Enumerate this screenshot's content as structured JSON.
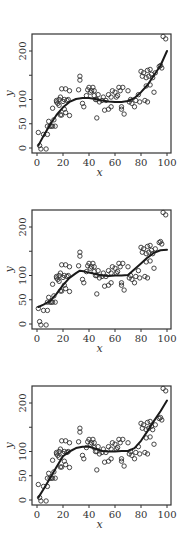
{
  "chart_data": [
    {
      "type": "scatter",
      "panel": "a",
      "caption": "(a)",
      "xlabel": "x",
      "ylabel": "y",
      "xlim": [
        -3,
        103
      ],
      "ylim": [
        -12,
        235
      ],
      "xticks": [
        0,
        20,
        40,
        60,
        80,
        100
      ],
      "yticks": [
        0,
        50,
        100,
        150,
        200
      ],
      "ytick_labels": [
        "0",
        "50",
        "100",
        "",
        "200"
      ],
      "grid": false,
      "fit": {
        "name": "smooth fit (a)",
        "x": [
          1,
          5,
          10,
          15,
          20,
          25,
          30,
          35,
          40,
          45,
          50,
          55,
          60,
          65,
          70,
          75,
          80,
          85,
          90,
          95,
          100
        ],
        "y": [
          5,
          25,
          48,
          68,
          84,
          95,
          101,
          103,
          103,
          101,
          98,
          96,
          95,
          95,
          97,
          103,
          115,
          130,
          150,
          170,
          200
        ]
      }
    },
    {
      "type": "scatter",
      "panel": "b",
      "caption": "(b)",
      "xlabel": "x",
      "ylabel": "y",
      "xlim": [
        -3,
        103
      ],
      "ylim": [
        -12,
        235
      ],
      "xticks": [
        0,
        20,
        40,
        60,
        80,
        100
      ],
      "yticks": [
        0,
        50,
        100,
        150,
        200
      ],
      "ytick_labels": [
        "0",
        "50",
        "100",
        "",
        "200"
      ],
      "grid": false,
      "fit": {
        "name": "smooth fit (b)",
        "x": [
          1,
          5,
          10,
          15,
          20,
          25,
          30,
          33,
          37,
          40,
          45,
          50,
          55,
          60,
          65,
          70,
          75,
          80,
          85,
          90,
          95,
          100
        ],
        "y": [
          35,
          40,
          47,
          62,
          80,
          95,
          105,
          110,
          108,
          106,
          103,
          100,
          99,
          100,
          100,
          101,
          113,
          125,
          137,
          147,
          152,
          153
        ]
      }
    },
    {
      "type": "scatter",
      "panel": "c",
      "caption": "(c)",
      "xlabel": "x",
      "ylabel": "y",
      "xlim": [
        -3,
        103
      ],
      "ylim": [
        -12,
        235
      ],
      "xticks": [
        0,
        20,
        40,
        60,
        80,
        100
      ],
      "yticks": [
        0,
        50,
        100,
        150,
        200
      ],
      "ytick_labels": [
        "0",
        "50",
        "100",
        "",
        "200"
      ],
      "grid": false,
      "fit": {
        "name": "smooth fit (c)",
        "x": [
          1,
          5,
          10,
          15,
          20,
          25,
          30,
          35,
          40,
          45,
          50,
          55,
          60,
          65,
          70,
          75,
          80,
          85,
          90,
          95,
          100
        ],
        "y": [
          5,
          22,
          45,
          68,
          90,
          100,
          107,
          110,
          110,
          106,
          101,
          100,
          100,
          101,
          101,
          107,
          122,
          142,
          163,
          183,
          205
        ]
      }
    }
  ],
  "scatter_points": {
    "x": [
      1,
      2,
      3,
      5,
      7,
      8,
      8,
      9,
      10,
      11,
      12,
      12,
      13,
      14,
      15,
      15,
      16,
      17,
      17,
      18,
      18,
      19,
      19,
      20,
      21,
      21,
      22,
      22,
      23,
      24,
      25,
      25,
      32,
      33,
      33,
      35,
      36,
      38,
      39,
      40,
      41,
      42,
      43,
      44,
      44,
      45,
      46,
      46,
      47,
      48,
      50,
      51,
      52,
      53,
      55,
      55,
      57,
      57,
      58,
      60,
      61,
      62,
      63,
      64,
      65,
      65,
      66,
      67,
      70,
      71,
      72,
      73,
      75,
      76,
      78,
      79,
      80,
      81,
      82,
      83,
      84,
      84,
      85,
      85,
      86,
      87,
      87,
      88,
      89,
      90,
      91,
      94,
      95,
      96,
      97,
      99
    ],
    "y": [
      32,
      5,
      -2,
      28,
      -2,
      28,
      45,
      55,
      45,
      45,
      45,
      82,
      58,
      45,
      95,
      98,
      92,
      100,
      88,
      105,
      68,
      68,
      122,
      96,
      100,
      80,
      122,
      73,
      98,
      100,
      118,
      67,
      120,
      140,
      148,
      92,
      85,
      108,
      120,
      125,
      115,
      118,
      125,
      118,
      108,
      100,
      100,
      62,
      110,
      95,
      98,
      105,
      78,
      98,
      80,
      110,
      85,
      105,
      118,
      115,
      105,
      108,
      125,
      118,
      80,
      85,
      125,
      70,
      118,
      95,
      100,
      92,
      85,
      98,
      110,
      95,
      158,
      148,
      155,
      98,
      145,
      128,
      160,
      95,
      148,
      162,
      130,
      152,
      145,
      115,
      155,
      168,
      170,
      165,
      230,
      225
    ]
  },
  "panels": {
    "a": {
      "caption": "(a)",
      "xlabel": "x",
      "ylabel": "y"
    },
    "b": {
      "caption": "(b)",
      "xlabel": "x",
      "ylabel": "y"
    },
    "c": {
      "caption": "(c)",
      "xlabel": "x",
      "ylabel": "y"
    }
  },
  "style": {
    "point_color": "#333333",
    "line_color": "#1a1a1a",
    "frame_color": "#333333"
  }
}
